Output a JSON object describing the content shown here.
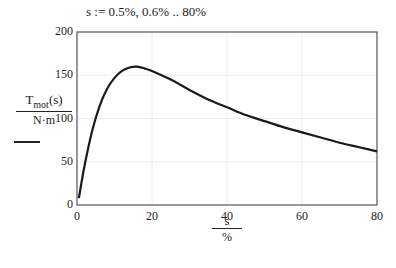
{
  "definition": "s := 0.5%, 0.6% .. 80%",
  "y_axis": {
    "numerator": "T",
    "numerator_sub": "mot",
    "numerator_arg": "(s)",
    "denominator": "N·m"
  },
  "x_axis": {
    "numerator": "s",
    "denominator": "%"
  },
  "chart_data": {
    "type": "line",
    "title": "",
    "xlabel": "s / %",
    "ylabel": "Tmot(s) / N·m",
    "xlim": [
      0,
      80
    ],
    "ylim": [
      0,
      200
    ],
    "xticks": [
      0,
      20,
      40,
      60,
      80
    ],
    "yticks": [
      0,
      50,
      100,
      150,
      200
    ],
    "grid": true,
    "series": [
      {
        "name": "Tmot(s)",
        "color": "#1a1a1a",
        "x": [
          0.5,
          2,
          4,
          6,
          8,
          10,
          12,
          14,
          16,
          18,
          20,
          25,
          30,
          35,
          40,
          45,
          50,
          55,
          60,
          65,
          70,
          75,
          80
        ],
        "y": [
          8,
          45,
          85,
          114,
          134,
          147,
          155,
          159,
          160,
          158,
          155,
          145,
          133,
          122,
          113,
          104,
          97,
          90,
          84,
          78,
          72,
          67,
          62
        ]
      }
    ]
  }
}
